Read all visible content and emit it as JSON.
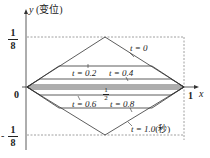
{
  "axes": {
    "y_label": "y",
    "y_unit": "(变位)",
    "x_label": "x",
    "origin": "0",
    "x_end": "1",
    "y_top_num": "1",
    "y_top_den": "8",
    "y_bot_sign": "-",
    "y_bot_num": "1",
    "y_bot_den": "8",
    "mid_num": "1",
    "mid_den": "2"
  },
  "curves": [
    {
      "t_label": "t = 0",
      "peak": 0.125
    },
    {
      "t_label": "t = 0.2",
      "peak": 0.101
    },
    {
      "t_label": "t = 0.4",
      "peak": 0.039
    },
    {
      "t_label": "t = 0.6",
      "peak": -0.039
    },
    {
      "t_label": "t = 0.8",
      "peak": -0.101
    },
    {
      "t_label": "t = 1.0",
      "peak": -0.125,
      "unit": "(秒)"
    }
  ],
  "labels": {
    "t0": "t = 0",
    "t02": "t = 0.2",
    "t04": "t = 0.4",
    "t06": "t = 0.6",
    "t08": "t = 0.8",
    "t10": "t = 1.0",
    "t10_unit": "(秒)"
  },
  "colors": {
    "line": "#333333",
    "dash": "#888888"
  }
}
